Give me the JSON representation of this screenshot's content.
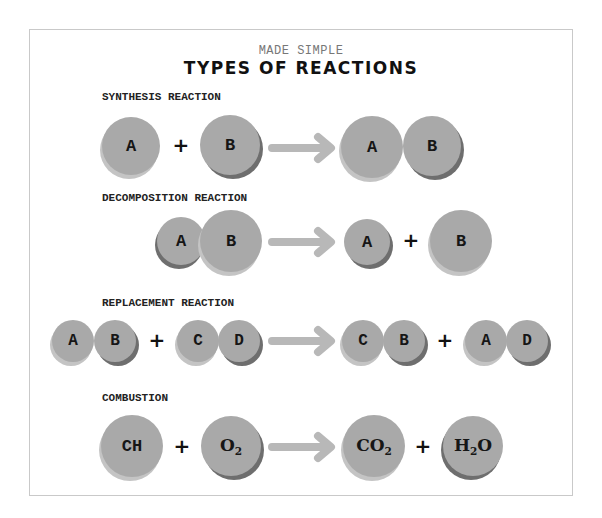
{
  "header": {
    "subtitle": "MADE SIMPLE",
    "title": "TYPES OF REACTIONS"
  },
  "sections": [
    {
      "label": "SYNTHESIS REACTION",
      "reactants": [
        [
          "A"
        ],
        [
          "B"
        ]
      ],
      "products": [
        [
          "A",
          "B"
        ]
      ]
    },
    {
      "label": "DECOMPOSITION REACTION",
      "reactants": [
        [
          "A",
          "B"
        ]
      ],
      "products": [
        [
          "A"
        ],
        [
          "B"
        ]
      ]
    },
    {
      "label": "REPLACEMENT REACTION",
      "reactants": [
        [
          "A",
          "B"
        ],
        [
          "C",
          "D"
        ]
      ],
      "products": [
        [
          "C",
          "B"
        ],
        [
          "A",
          "D"
        ]
      ]
    },
    {
      "label": "COMBUSTION",
      "reactants": [
        [
          "CH"
        ],
        [
          "O2"
        ]
      ],
      "products": [
        [
          "CO2"
        ],
        [
          "H2O"
        ]
      ]
    }
  ],
  "symbols": {
    "plus": "+",
    "arrow": "arrow-right-icon"
  },
  "molecules": {
    "ch": {
      "main": "CH"
    },
    "o2": {
      "main": "O",
      "sub": "2"
    },
    "co2": {
      "main": "CO",
      "sub": "2"
    },
    "h2o": {
      "pre": "H",
      "sub": "2",
      "post": "O"
    }
  },
  "colors": {
    "atom_fill": "#a9a9a9",
    "atom_shadow_dark": "#6e6e6e",
    "atom_shadow_light": "#c4c4c4",
    "arrow": "#b8b8b8",
    "border": "#c9c9c9",
    "text": "#161616"
  }
}
